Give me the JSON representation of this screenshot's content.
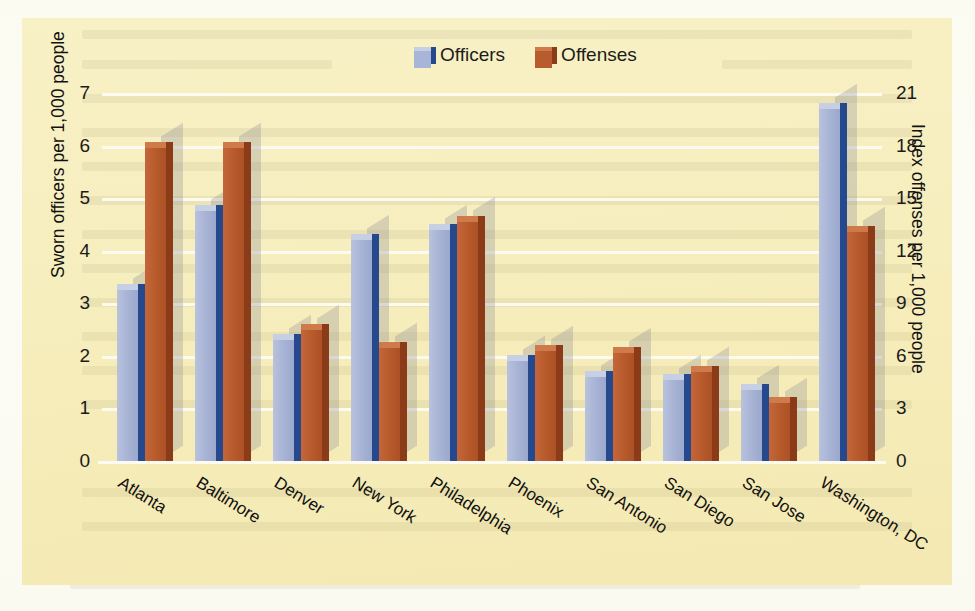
{
  "chart_data": {
    "type": "bar",
    "title": "",
    "categories": [
      "Atlanta",
      "Baltimore",
      "Denver",
      "New York",
      "Philadelphia",
      "Phoenix",
      "San Antonio",
      "San Diego",
      "San Jose",
      "Washington, DC"
    ],
    "series": [
      {
        "name": "Officers",
        "axis": "left",
        "color": "#a9b5d6",
        "values": [
          3.25,
          4.75,
          2.3,
          4.2,
          4.4,
          1.9,
          1.6,
          1.55,
          1.35,
          6.7
        ]
      },
      {
        "name": "Offenses",
        "axis": "right",
        "color": "#b95c2d",
        "values": [
          17.85,
          17.85,
          7.5,
          6.45,
          13.65,
          6.3,
          6.15,
          5.1,
          3.3,
          13.05
        ]
      }
    ],
    "offenses_left_scale_equivalent": [
      5.95,
      5.95,
      2.5,
      2.15,
      4.55,
      2.1,
      2.05,
      1.7,
      1.1,
      4.35
    ],
    "xlabel": "",
    "ylabel": "Sworn officers per 1,000 people",
    "y2label": "Index offenses per 1,000 people",
    "ylim": [
      0,
      7
    ],
    "y2lim": [
      0,
      21
    ],
    "yticks": [
      "0",
      "1",
      "2",
      "3",
      "4",
      "5",
      "6",
      "7"
    ],
    "y2ticks": [
      "0",
      "3",
      "6",
      "9",
      "12",
      "15",
      "18",
      "21"
    ],
    "grid": true,
    "legend_position": "top-center",
    "legend": [
      "Officers",
      "Offenses"
    ],
    "colors": {
      "panel_background": "#f7efbf",
      "page_background": "#fdfdf6",
      "gridline": "#fdfaf0",
      "officers_front": "#a9b5d6",
      "officers_side": "#26488c",
      "officers_top": "#c7cfe4",
      "offenses_front": "#b95c2d",
      "offenses_side": "#8c3b18",
      "offenses_top": "#cf7a4b",
      "text": "#111111"
    }
  },
  "axes": {
    "left_title": "Sworn officers per 1,000 people",
    "right_title": "Index offenses per 1,000 people",
    "left_ticks": [
      "7",
      "6",
      "5",
      "4",
      "3",
      "2",
      "1",
      "0"
    ],
    "right_ticks": [
      "21",
      "18",
      "15",
      "12",
      "9",
      "6",
      "3",
      "0"
    ]
  },
  "legend": {
    "items": [
      {
        "label": "Officers",
        "key": "officers"
      },
      {
        "label": "Offenses",
        "key": "offenses"
      }
    ]
  }
}
